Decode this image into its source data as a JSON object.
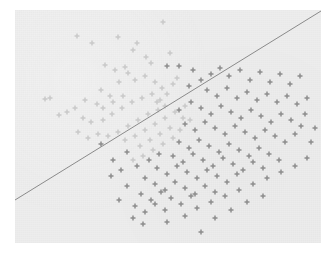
{
  "figure": {
    "title": "",
    "background_color": "#ffffff",
    "panel_color": "#ededed",
    "panel_rect": {
      "x": 15,
      "y": 10,
      "width": 306,
      "height": 233
    }
  },
  "chart_data": {
    "type": "scatter",
    "title": "",
    "subtitle": "",
    "xlabel": "",
    "ylabel": "",
    "xlim": [
      0,
      306
    ],
    "ylim": [
      0,
      233
    ],
    "grid": false,
    "legend": null,
    "axes_visible": false,
    "tick_labels": {
      "x": [],
      "y": []
    },
    "marker": "plus",
    "marker_size": 5,
    "annotations": [],
    "decision_boundary": {
      "name": "separating-line",
      "type": "line",
      "color": "#8a8a8a",
      "width": 1,
      "x0": 0,
      "y0": 190,
      "x1": 306,
      "y1": 1
    },
    "series": [
      {
        "name": "class-a",
        "color": "#c9c9c9",
        "marker": "plus",
        "points": [
          [
            62,
            26
          ],
          [
            77,
            33
          ],
          [
            103,
            27
          ],
          [
            122,
            33
          ],
          [
            148,
            12
          ],
          [
            118,
            40
          ],
          [
            131,
            47
          ],
          [
            136,
            53
          ],
          [
            155,
            43
          ],
          [
            90,
            55
          ],
          [
            100,
            60
          ],
          [
            110,
            57
          ],
          [
            113,
            63
          ],
          [
            120,
            70
          ],
          [
            130,
            66
          ],
          [
            140,
            72
          ],
          [
            147,
            78
          ],
          [
            86,
            80
          ],
          [
            95,
            86
          ],
          [
            104,
            72
          ],
          [
            82,
            94
          ],
          [
            70,
            90
          ],
          [
            60,
            98
          ],
          [
            52,
            102
          ],
          [
            44,
            105
          ],
          [
            30,
            89
          ],
          [
            35,
            88
          ],
          [
            68,
            108
          ],
          [
            76,
            112
          ],
          [
            88,
            110
          ],
          [
            97,
            104
          ],
          [
            107,
            98
          ],
          [
            117,
            92
          ],
          [
            127,
            88
          ],
          [
            137,
            84
          ],
          [
            145,
            90
          ],
          [
            152,
            84
          ],
          [
            158,
            74
          ],
          [
            162,
            68
          ],
          [
            143,
            100
          ],
          [
            133,
            104
          ],
          [
            123,
            110
          ],
          [
            113,
            116
          ],
          [
            103,
            122
          ],
          [
            93,
            126
          ],
          [
            83,
            124
          ],
          [
            73,
            128
          ],
          [
            63,
            122
          ],
          [
            110,
            130
          ],
          [
            120,
            126
          ],
          [
            130,
            120
          ],
          [
            140,
            114
          ],
          [
            150,
            108
          ],
          [
            160,
            102
          ],
          [
            170,
            96
          ],
          [
            168,
            108
          ],
          [
            155,
            118
          ],
          [
            145,
            124
          ],
          [
            135,
            130
          ],
          [
            125,
            136
          ],
          [
            158,
            128
          ],
          [
            148,
            134
          ],
          [
            138,
            140
          ],
          [
            128,
            146
          ],
          [
            118,
            150
          ],
          [
            165,
            120
          ],
          [
            175,
            110
          ],
          [
            150,
            96
          ],
          [
            142,
            92
          ],
          [
            108,
            86
          ],
          [
            98,
            92
          ],
          [
            88,
            98
          ]
        ]
      },
      {
        "name": "class-b",
        "color": "#8c8c8c",
        "marker": "plus",
        "points": [
          [
            178,
            60
          ],
          [
            186,
            70
          ],
          [
            196,
            64
          ],
          [
            205,
            58
          ],
          [
            214,
            66
          ],
          [
            225,
            60
          ],
          [
            235,
            70
          ],
          [
            245,
            62
          ],
          [
            255,
            72
          ],
          [
            265,
            64
          ],
          [
            275,
            74
          ],
          [
            285,
            66
          ],
          [
            192,
            80
          ],
          [
            202,
            86
          ],
          [
            212,
            78
          ],
          [
            222,
            88
          ],
          [
            232,
            82
          ],
          [
            242,
            90
          ],
          [
            252,
            84
          ],
          [
            262,
            92
          ],
          [
            272,
            86
          ],
          [
            282,
            94
          ],
          [
            292,
            88
          ],
          [
            176,
            92
          ],
          [
            186,
            98
          ],
          [
            196,
            104
          ],
          [
            206,
            96
          ],
          [
            216,
            102
          ],
          [
            226,
            108
          ],
          [
            236,
            100
          ],
          [
            246,
            106
          ],
          [
            256,
            112
          ],
          [
            266,
            104
          ],
          [
            276,
            110
          ],
          [
            286,
            116
          ],
          [
            170,
            114
          ],
          [
            180,
            120
          ],
          [
            190,
            112
          ],
          [
            200,
            118
          ],
          [
            210,
            124
          ],
          [
            220,
            116
          ],
          [
            230,
            122
          ],
          [
            240,
            128
          ],
          [
            250,
            120
          ],
          [
            260,
            126
          ],
          [
            270,
            132
          ],
          [
            280,
            124
          ],
          [
            164,
            132
          ],
          [
            174,
            138
          ],
          [
            184,
            130
          ],
          [
            194,
            136
          ],
          [
            204,
            142
          ],
          [
            214,
            134
          ],
          [
            224,
            140
          ],
          [
            234,
            146
          ],
          [
            244,
            138
          ],
          [
            254,
            144
          ],
          [
            264,
            150
          ],
          [
            158,
            146
          ],
          [
            168,
            152
          ],
          [
            178,
            144
          ],
          [
            188,
            150
          ],
          [
            198,
            156
          ],
          [
            208,
            148
          ],
          [
            218,
            154
          ],
          [
            228,
            160
          ],
          [
            238,
            152
          ],
          [
            248,
            158
          ],
          [
            142,
            158
          ],
          [
            152,
            164
          ],
          [
            162,
            156
          ],
          [
            172,
            162
          ],
          [
            182,
            168
          ],
          [
            192,
            160
          ],
          [
            202,
            166
          ],
          [
            212,
            172
          ],
          [
            222,
            164
          ],
          [
            130,
            168
          ],
          [
            140,
            174
          ],
          [
            150,
            180
          ],
          [
            160,
            172
          ],
          [
            170,
            178
          ],
          [
            180,
            184
          ],
          [
            190,
            176
          ],
          [
            200,
            182
          ],
          [
            126,
            184
          ],
          [
            136,
            190
          ],
          [
            146,
            182
          ],
          [
            156,
            188
          ],
          [
            166,
            194
          ],
          [
            176,
            186
          ],
          [
            120,
            196
          ],
          [
            130,
            202
          ],
          [
            140,
            194
          ],
          [
            150,
            200
          ],
          [
            118,
            208
          ],
          [
            128,
            214
          ],
          [
            152,
            212
          ],
          [
            170,
            206
          ],
          [
            182,
            198
          ],
          [
            196,
            192
          ],
          [
            210,
            186
          ],
          [
            224,
            180
          ],
          [
            238,
            174
          ],
          [
            252,
            168
          ],
          [
            266,
            162
          ],
          [
            280,
            156
          ],
          [
            292,
            148
          ],
          [
            296,
            132
          ],
          [
            300,
            118
          ],
          [
            290,
            104
          ],
          [
            186,
            222
          ],
          [
            112,
            176
          ],
          [
            106,
            160
          ],
          [
            98,
            150
          ],
          [
            112,
            142
          ],
          [
            122,
            156
          ],
          [
            134,
            150
          ],
          [
            144,
            144
          ],
          [
            96,
            166
          ],
          [
            104,
            190
          ],
          [
            86,
            134
          ],
          [
            200,
            208
          ],
          [
            216,
            200
          ],
          [
            232,
            192
          ],
          [
            248,
            186
          ],
          [
            164,
            100
          ],
          [
            174,
            76
          ],
          [
            164,
            56
          ],
          [
            152,
            56
          ]
        ]
      }
    ]
  }
}
